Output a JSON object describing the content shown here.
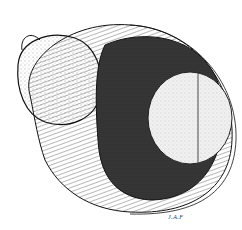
{
  "illustration": {
    "subject": "stippled anatomical cross-section drawing",
    "signature": "J.A.F",
    "colors": {
      "background": "#ffffff",
      "ink": "#111111",
      "dark_fill": "#1a1a1a",
      "light_fill": "#eeeeee"
    }
  }
}
